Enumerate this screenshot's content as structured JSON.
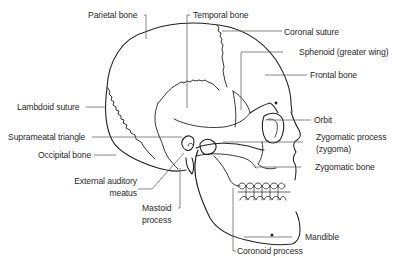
{
  "diagram": {
    "line_color": "#222222",
    "leader_color": "#555555",
    "labels": [
      {
        "id": "parietal-bone",
        "text": "Parietal bone"
      },
      {
        "id": "temporal-bone",
        "text": "Temporal bone"
      },
      {
        "id": "coronal-suture",
        "text": "Coronal suture"
      },
      {
        "id": "sphenoid-greater-wing",
        "text": "Sphenoid (greater wing)"
      },
      {
        "id": "frontal-bone",
        "text": "Frontal bone"
      },
      {
        "id": "lambdoid-suture",
        "text": "Lambdoid suture"
      },
      {
        "id": "orbit",
        "text": "Orbit"
      },
      {
        "id": "suprameatal-triangle",
        "text": "Suprameatal triangle"
      },
      {
        "id": "zygomatic-process-line1",
        "text": "Zygomatic process"
      },
      {
        "id": "zygomatic-process-line2",
        "text": "(zygoma)"
      },
      {
        "id": "occipital-bone",
        "text": "Occipital bone"
      },
      {
        "id": "zygomatic-bone",
        "text": "Zygomatic bone"
      },
      {
        "id": "external-auditory-line1",
        "text": "External auditory"
      },
      {
        "id": "external-auditory-line2",
        "text": "meatus"
      },
      {
        "id": "mastoid-line1",
        "text": "Mastoid"
      },
      {
        "id": "mastoid-line2",
        "text": "process"
      },
      {
        "id": "mandible",
        "text": "Mandible"
      },
      {
        "id": "coronoid-process",
        "text": "Coronoid process"
      }
    ]
  }
}
